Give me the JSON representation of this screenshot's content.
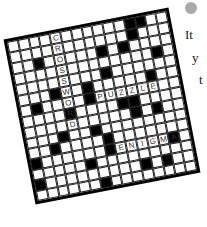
{
  "illustration": {
    "type": "crossword-puzzle",
    "rows": 15,
    "cols": 15,
    "words": [
      {
        "text": "CROSSWORD",
        "direction": "down",
        "row": 0,
        "col": 4
      },
      {
        "text": "PUZZLE",
        "direction": "across",
        "row": 6,
        "col": 7
      },
      {
        "text": "ENIGMA",
        "direction": "across",
        "row": 11,
        "col": 8
      }
    ],
    "black_cells": [
      [
        0,
        11
      ],
      [
        0,
        12
      ],
      [
        1,
        11
      ],
      [
        2,
        2
      ],
      [
        2,
        8
      ],
      [
        2,
        10
      ],
      [
        3,
        13
      ],
      [
        4,
        8
      ],
      [
        5,
        6
      ],
      [
        5,
        3
      ],
      [
        5,
        12
      ],
      [
        6,
        1
      ],
      [
        6,
        6
      ],
      [
        7,
        9
      ],
      [
        7,
        10
      ],
      [
        7,
        4
      ],
      [
        8,
        10
      ],
      [
        8,
        12
      ],
      [
        9,
        6
      ],
      [
        9,
        3
      ],
      [
        10,
        2
      ],
      [
        10,
        7
      ],
      [
        11,
        0
      ],
      [
        11,
        7
      ],
      [
        11,
        13
      ],
      [
        12,
        5
      ],
      [
        13,
        0
      ],
      [
        13,
        10
      ],
      [
        13,
        12
      ],
      [
        14,
        6
      ]
    ]
  },
  "side_text": {
    "icon": "thumbs-up-icon",
    "lines": [
      "It",
      "y",
      "t"
    ]
  }
}
